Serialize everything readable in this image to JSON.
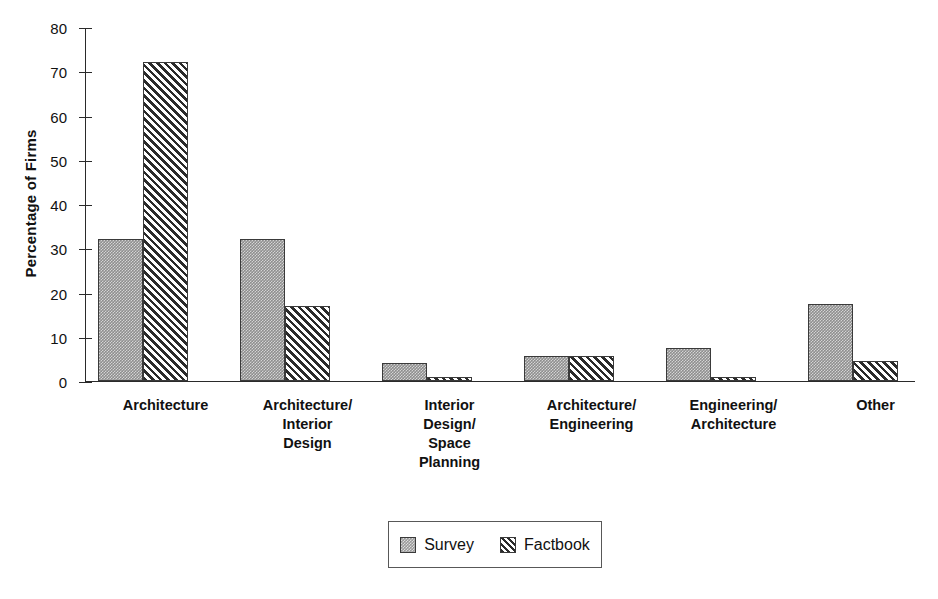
{
  "chart_data": {
    "type": "bar",
    "title": "",
    "xlabel": "",
    "ylabel": "Percentage of Firms",
    "ylim": [
      0,
      80
    ],
    "yticks": [
      0,
      10,
      20,
      30,
      40,
      50,
      60,
      70,
      80
    ],
    "ytick_labels": [
      "0",
      "10",
      "20",
      "30",
      "40",
      "50",
      "60",
      "70",
      "80"
    ],
    "grid": false,
    "legend_position": "bottom-center",
    "categories": [
      "Architecture",
      "Architecture/\nInterior\nDesign",
      "Interior\nDesign/\nSpace\nPlanning",
      "Architecture/\nEngineering",
      "Engineering/\nArchitecture",
      "Other"
    ],
    "series": [
      {
        "name": "Survey",
        "pattern": "solid-gray-stipple",
        "color": "#8e8e8e",
        "values": [
          32,
          32,
          4,
          5.7,
          7.5,
          17.5
        ]
      },
      {
        "name": "Factbook",
        "pattern": "diagonal-hatch",
        "color": "#2b2b2b",
        "values": [
          72,
          17,
          1,
          5.7,
          1,
          4.5
        ]
      }
    ]
  },
  "legend": {
    "items": [
      {
        "label": "Survey"
      },
      {
        "label": "Factbook"
      }
    ]
  }
}
